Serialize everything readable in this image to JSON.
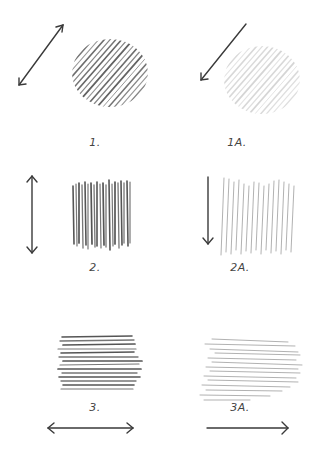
{
  "figure": {
    "background": "#ffffff",
    "ink_dark": "#3a3a3a",
    "ink_light": "#9a9a9a",
    "panels": [
      {
        "id": "1",
        "label": "1.",
        "stroke_direction": "diagonal",
        "arrow": "double-headed",
        "pressure": "heavy",
        "label_pos": [
          95,
          142
        ]
      },
      {
        "id": "1A",
        "label": "1A.",
        "stroke_direction": "diagonal",
        "arrow": "single-headed down-left",
        "pressure": "light",
        "label_pos": [
          237,
          142
        ]
      },
      {
        "id": "2",
        "label": "2.",
        "stroke_direction": "vertical",
        "arrow": "double-headed",
        "pressure": "heavy",
        "label_pos": [
          95,
          267
        ]
      },
      {
        "id": "2A",
        "label": "2A.",
        "stroke_direction": "vertical",
        "arrow": "single-headed down",
        "pressure": "light",
        "label_pos": [
          240,
          267
        ]
      },
      {
        "id": "3",
        "label": "3.",
        "stroke_direction": "horizontal",
        "arrow": "double-headed",
        "pressure": "heavy",
        "label_pos": [
          95,
          407
        ]
      },
      {
        "id": "3A",
        "label": "3A.",
        "stroke_direction": "horizontal",
        "arrow": "single-headed right",
        "pressure": "light",
        "label_pos": [
          240,
          407
        ]
      }
    ]
  }
}
